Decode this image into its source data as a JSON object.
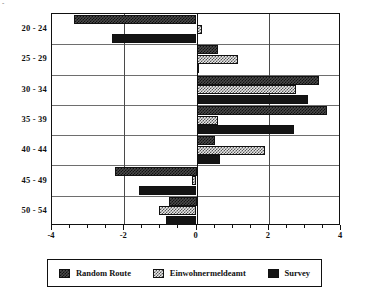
{
  "chart_data": {
    "type": "bar",
    "orientation": "horizontal",
    "title": "",
    "xlabel": "",
    "ylabel": "",
    "xlim": [
      -4,
      4
    ],
    "xticks": [
      -4,
      -2,
      0,
      2,
      4
    ],
    "xtick_labels": [
      "-4",
      "-2",
      "0",
      "2",
      "4"
    ],
    "minor_ticks_per_interval": 4,
    "grid": {
      "horizontal": true,
      "vertical": true,
      "zero_line": true
    },
    "legend_position": "bottom",
    "categories": [
      "20 - 24",
      "25 - 29",
      "30 - 34",
      "35 - 39",
      "40 - 44",
      "45 - 49",
      "50 - 54"
    ],
    "series": [
      {
        "name": "Random Route",
        "pattern": "dark-checker",
        "color": "#4a4a4a",
        "values": [
          -3.4,
          0.6,
          3.4,
          3.6,
          0.5,
          -2.25,
          -0.75
        ]
      },
      {
        "name": "Einwohnermeldeamt",
        "pattern": "light-checker",
        "color": "#e8e8e8",
        "values": [
          0.15,
          1.15,
          2.75,
          0.6,
          1.9,
          -0.13,
          -1.05
        ]
      },
      {
        "name": "Survey",
        "pattern": "solid",
        "color": "#141414",
        "values": [
          -2.35,
          0.08,
          3.1,
          2.7,
          0.65,
          -1.6,
          -0.85
        ]
      }
    ]
  },
  "legend": {
    "items": [
      {
        "label": "Random Route",
        "swatch": "dark-checker"
      },
      {
        "label": "Einwohnermeldeamt",
        "swatch": "light-checker"
      },
      {
        "label": "Survey",
        "swatch": "solid"
      }
    ]
  }
}
